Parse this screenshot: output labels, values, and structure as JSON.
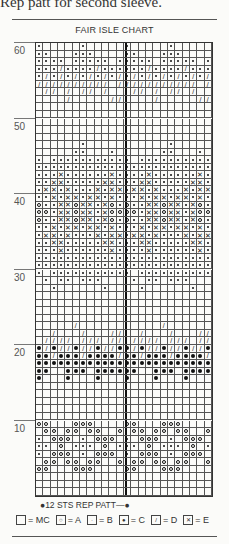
{
  "page": {
    "top_text": "Rep patt for second sleeve.",
    "title": "FAIR ISLE CHART",
    "repeat_label": "●12 STS REP PATT—●"
  },
  "legend": [
    {
      "symbol": "empty",
      "glyph": "",
      "label": "= MC"
    },
    {
      "symbol": "ring",
      "glyph": "○",
      "label": "= A"
    },
    {
      "symbol": "small-dot",
      "glyph": "·",
      "label": "= B"
    },
    {
      "symbol": "large-dot",
      "glyph": "●",
      "label": "= C"
    },
    {
      "symbol": "slash",
      "glyph": "/",
      "label": "= D"
    },
    {
      "symbol": "cross",
      "glyph": "✕",
      "label": "= E"
    }
  ],
  "row_labels": [
    "60",
    "50",
    "40",
    "30",
    "20",
    "10"
  ],
  "chart_data": {
    "type": "table",
    "title": "FAIR ISLE CHART",
    "columns": 24,
    "rows": 60,
    "repeat_width": 12,
    "key": {
      ".": "MC",
      "o": "A",
      "b": "B",
      "C": "C",
      "/": "D",
      "x": "E"
    },
    "pattern_top_to_bottom": [
      "b.....b.....",
      "bb...bbb....",
      "bbbb.bbbbb.b",
      "bbb/bbbb/bbb",
      "b/b/b/b/b/b/",
      "//////////./",
      ".//././/./..",
      "..../.....//",
      "............",
      "............",
      "............",
      "............",
      "............",
      "......b.....",
      ".....bb...b.",
      "b.bbbbbbbbbb",
      "bbbbbbbbbbbb",
      "bbbxbbbbbbxb",
      "bbxxbbbbbxxb",
      "bxxbxbbbxbxx",
      "bbxbxxbxxbxb",
      "obbxxoxxbxob",
      "oobxxoxxbxoo",
      "obbxxoxxbxob",
      "bbxbxxbxxbxb",
      "bxxbxbbbxbxx",
      "bbxxbbbbbxxb",
      "bbbxbbbbbbxb",
      "bbbbbbbbbbbb",
      "bbbbbbbbbbbb",
      "b.bbbbbbbbbb",
      ".b.bb.bbb...",
      "..b......b..",
      "............",
      "............",
      "............",
      "............",
      "...../......",
      "../.../...//",
      ".////.///.//",
      "C/C//C//C//C",
      "CC/CCC/CCCC/",
      "CCCCCCCCCCCC",
      "CC..CCC.CCCC",
      "C...C...C...",
      "............",
      "............",
      "............",
      "............",
      "............",
      "oo...ooo....",
      ".oo.oo.oo..o",
      "b.ooo.b.ooo.",
      "bb.o.bbb.o.b",
      "b.ooo.b.ooo.",
      ".oo.oo.oo..o",
      "oo...ooo....",
      "............",
      "............",
      "............"
    ]
  }
}
